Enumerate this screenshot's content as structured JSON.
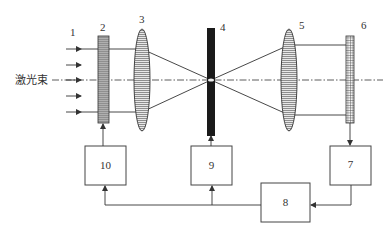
{
  "diagram": {
    "type": "optical-system-schematic",
    "axis_label": "激光束",
    "colors": {
      "line": "#333333",
      "plate_fill": "#8a8a8a",
      "lens_fill": "#e6e6e6",
      "element4_fill": "#1a1a1a",
      "background": "#ffffff"
    },
    "components": [
      {
        "id": "1",
        "label": "1",
        "kind": "incident-beam-arrows"
      },
      {
        "id": "2",
        "label": "2",
        "kind": "striped-plate"
      },
      {
        "id": "3",
        "label": "3",
        "kind": "lens"
      },
      {
        "id": "4",
        "label": "4",
        "kind": "black-plate-at-focus"
      },
      {
        "id": "5",
        "label": "5",
        "kind": "lens"
      },
      {
        "id": "6",
        "label": "6",
        "kind": "grid-detector"
      }
    ],
    "boxes": [
      {
        "id": "10",
        "label": "10"
      },
      {
        "id": "9",
        "label": "9"
      },
      {
        "id": "7",
        "label": "7"
      },
      {
        "id": "8",
        "label": "8"
      }
    ],
    "connections": [
      {
        "from": "6",
        "to": "7"
      },
      {
        "from": "7",
        "to": "8"
      },
      {
        "from": "8",
        "to": "9"
      },
      {
        "from": "8",
        "to": "10"
      },
      {
        "from": "9",
        "to": "4"
      },
      {
        "from": "10",
        "to": "2"
      }
    ]
  }
}
